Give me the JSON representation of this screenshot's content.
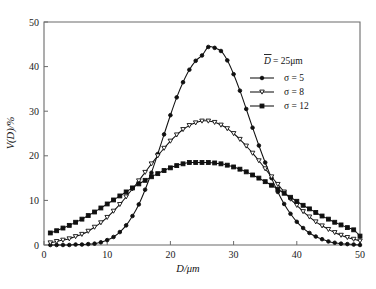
{
  "chart_data": {
    "type": "line",
    "title": "",
    "xlabel": "D/μm",
    "ylabel": "V(D)/%",
    "xlim": [
      0,
      50
    ],
    "ylim": [
      0,
      50
    ],
    "xticks": [
      0,
      10,
      20,
      30,
      40,
      50
    ],
    "yticks": [
      0,
      10,
      20,
      30,
      40,
      50
    ],
    "grid": false,
    "legend_position": "upper-right",
    "annotation": "D̄ = 25μm",
    "x": [
      1,
      2,
      3,
      4,
      5,
      6,
      7,
      8,
      9,
      10,
      11,
      12,
      13,
      14,
      15,
      16,
      17,
      18,
      19,
      20,
      21,
      22,
      23,
      24,
      25,
      26,
      27,
      28,
      29,
      30,
      31,
      32,
      33,
      34,
      35,
      36,
      37,
      38,
      39,
      40,
      41,
      42,
      43,
      44,
      45,
      46,
      47,
      48,
      49,
      50
    ],
    "series": [
      {
        "name": "σ = 5",
        "marker": "filled-circle",
        "values": [
          0.0,
          0.0,
          0.0,
          0.0,
          0.1,
          0.1,
          0.2,
          0.3,
          0.6,
          1.1,
          1.8,
          2.9,
          4.4,
          6.5,
          9.1,
          12.4,
          16.2,
          20.4,
          24.8,
          29.1,
          33.1,
          36.5,
          39.3,
          41.3,
          42.5,
          44.4,
          44.2,
          43.5,
          41.4,
          38.3,
          34.6,
          30.5,
          26.3,
          22.3,
          18.5,
          15.0,
          11.9,
          9.2,
          7.0,
          5.2,
          3.8,
          2.7,
          1.9,
          1.3,
          0.8,
          0.5,
          0.3,
          0.2,
          0.1,
          0.0
        ],
        "color": "#101010"
      },
      {
        "name": "σ = 8",
        "marker": "open-triangle-down",
        "values": [
          0.5,
          0.8,
          1.1,
          1.4,
          1.9,
          2.4,
          3.1,
          4.0,
          5.0,
          6.2,
          7.6,
          9.1,
          10.8,
          12.6,
          14.4,
          16.3,
          18.2,
          20.0,
          21.7,
          23.3,
          24.7,
          25.9,
          26.8,
          27.4,
          27.8,
          27.8,
          27.5,
          26.9,
          26.1,
          25.0,
          23.7,
          22.2,
          20.6,
          18.9,
          17.1,
          15.3,
          13.6,
          11.9,
          10.3,
          8.9,
          7.5,
          6.3,
          5.2,
          4.3,
          3.5,
          2.8,
          2.2,
          1.7,
          1.3,
          0.9
        ],
        "color": "#101010"
      },
      {
        "name": "σ = 12",
        "marker": "filled-square",
        "values": [
          2.7,
          3.2,
          3.8,
          4.4,
          5.1,
          5.8,
          6.6,
          7.4,
          8.3,
          9.2,
          10.1,
          11.0,
          11.9,
          12.8,
          13.7,
          14.5,
          15.3,
          16.0,
          16.7,
          17.3,
          17.8,
          18.2,
          18.5,
          18.5,
          18.5,
          18.5,
          18.4,
          18.2,
          17.9,
          17.5,
          17.0,
          16.4,
          15.7,
          15.0,
          14.2,
          13.4,
          12.5,
          11.6,
          10.7,
          9.8,
          8.9,
          8.1,
          7.3,
          6.5,
          5.8,
          5.1,
          4.5,
          3.9,
          3.4,
          2.0
        ],
        "color": "#101010"
      }
    ]
  },
  "axes": {
    "x_label": "D/μm",
    "y_label": "V(D)/%",
    "x_tick_labels": [
      "0",
      "10",
      "20",
      "30",
      "40",
      "50"
    ],
    "y_tick_labels": [
      "0",
      "10",
      "20",
      "30",
      "40",
      "50"
    ]
  },
  "legend": {
    "annotation": "D̄ = 25μm",
    "annotation_symbol": "D",
    "annotation_value": "= 25μm",
    "entries": [
      {
        "label": "σ = 5",
        "marker": "filled-circle"
      },
      {
        "label": "σ = 8",
        "marker": "open-triangle-down"
      },
      {
        "label": "σ = 12",
        "marker": "filled-square"
      }
    ]
  },
  "colors": {
    "ink": "#101010",
    "axis": "#6b6b6b",
    "background": "#ffffff"
  }
}
